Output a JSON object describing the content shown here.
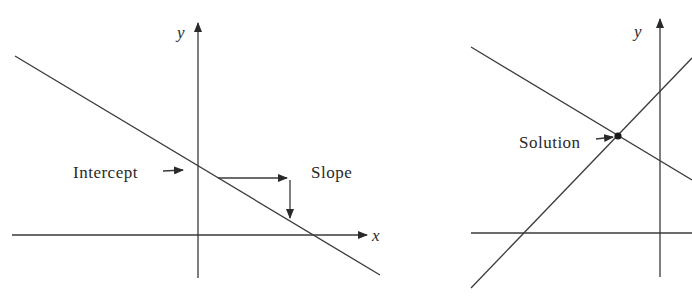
{
  "figures": {
    "left": {
      "title": "Intercept and slope of a line",
      "axis_x_label": "x",
      "axis_y_label": "y",
      "labels": {
        "intercept": "Intercept",
        "slope": "Slope"
      }
    },
    "right": {
      "title": "Intersection of two lines",
      "axis_y_label": "y",
      "labels": {
        "solution": "Solution"
      }
    }
  },
  "colors": {
    "ink": "#3a3a3a",
    "background": "#ffffff"
  }
}
